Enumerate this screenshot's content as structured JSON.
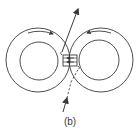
{
  "figure": {
    "caption": "(b)",
    "colors": {
      "stroke": "#3a3a3a",
      "background": "#ffffff"
    },
    "rings": [
      {
        "name": "left-ring",
        "flux_direction": "clockwise-top-right"
      },
      {
        "name": "right-ring",
        "flux_direction": "counterclockwise-top-left"
      }
    ],
    "wire": {
      "direction": "upward"
    },
    "coil": {
      "arrow_direction": "left"
    }
  }
}
